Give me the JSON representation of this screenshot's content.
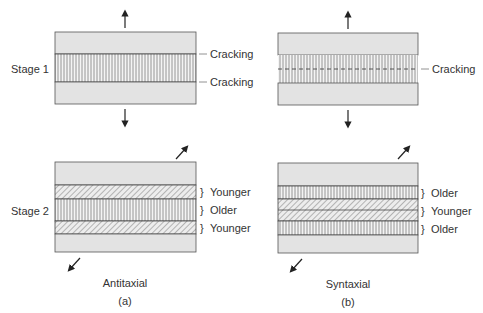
{
  "figure": {
    "row_labels": {
      "stage1": "Stage 1",
      "stage2": "Stage 2"
    },
    "panel_a": {
      "title": "Antitaxial",
      "tag": "(a)",
      "stage1_labels": {
        "top_crack": "Cracking",
        "bottom_crack": "Cracking"
      },
      "stage2_labels": {
        "top": "Younger",
        "middle": "Older",
        "bottom": "Younger"
      }
    },
    "panel_b": {
      "title": "Syntaxial",
      "tag": "(b)",
      "stage1_labels": {
        "crack": "Cracking"
      },
      "stage2_labels": {
        "top": "Older",
        "middle": "Younger",
        "bottom": "Older"
      }
    },
    "colors": {
      "wall_rock": "#e3e3e3",
      "outline": "#555555",
      "fiber": "#8a8a8a",
      "text": "#333333"
    }
  }
}
